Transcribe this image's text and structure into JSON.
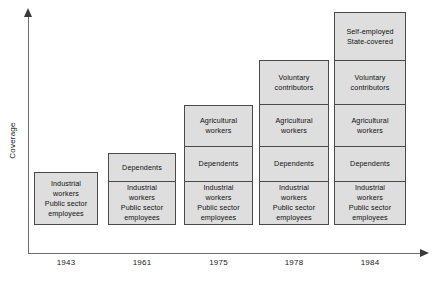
{
  "chart_data": {
    "type": "bar",
    "title": "",
    "subtitle": "",
    "xlabel": "",
    "ylabel": "Coverage",
    "stacked": true,
    "grid": false,
    "legend": false,
    "legend_position": "none",
    "axis_style": "arrow-axes, no tick marks, no numeric scale",
    "categories": [
      "1943",
      "1961",
      "1975",
      "1978",
      "1984"
    ],
    "series": [
      {
        "name": "Industrial workers / Public sector employees",
        "lines": [
          "Industrial",
          "workers",
          "Public sector",
          "employees"
        ],
        "values": [
          1,
          1,
          1,
          1,
          1
        ]
      },
      {
        "name": "Dependents",
        "lines": [
          "Dependents"
        ],
        "values": [
          0,
          1,
          1,
          1,
          1
        ]
      },
      {
        "name": "Agricultural workers",
        "lines": [
          "Agricultural",
          "workers"
        ],
        "values": [
          0,
          0,
          1,
          1,
          1
        ]
      },
      {
        "name": "Voluntary contributors",
        "lines": [
          "Voluntary",
          "contributors"
        ],
        "values": [
          0,
          0,
          0,
          1,
          1
        ]
      },
      {
        "name": "Self-employed / State-covered",
        "lines": [
          "Self-employed",
          "State-covered"
        ],
        "values": [
          0,
          0,
          0,
          0,
          1
        ]
      }
    ],
    "bar_totals_segments": [
      1,
      2,
      3,
      4,
      5
    ],
    "ylim": [
      0,
      5
    ]
  },
  "axes": {
    "y_title": "Coverage",
    "x_tick_labels": [
      "1943",
      "1961",
      "1975",
      "1978",
      "1984"
    ]
  },
  "bars": [
    {
      "year": "1943",
      "left": 34,
      "width": 64,
      "segments": [
        {
          "top": 200,
          "height": 53,
          "lines": [
            "Industrial",
            "workers",
            "Public sector",
            "employees"
          ]
        }
      ]
    },
    {
      "year": "1961",
      "left": 108,
      "width": 68,
      "segments": [
        {
          "top": 180,
          "height": 29,
          "lines": [
            "Dependents"
          ]
        },
        {
          "top": 209,
          "height": 44,
          "lines": [
            "Industrial",
            "workers",
            "Public sector",
            "employees"
          ]
        }
      ]
    },
    {
      "year": "1975",
      "left": 184,
      "width": 69,
      "segments": [
        {
          "top": 131,
          "height": 42,
          "lines": [
            "Agricultural",
            "workers"
          ]
        },
        {
          "top": 173,
          "height": 36,
          "lines": [
            "Dependents"
          ]
        },
        {
          "top": 209,
          "height": 44,
          "lines": [
            "Industrial",
            "workers",
            "Public sector",
            "employees"
          ]
        }
      ]
    },
    {
      "year": "1978",
      "left": 259,
      "width": 70,
      "segments": [
        {
          "top": 85,
          "height": 45,
          "lines": [
            "Voluntary",
            "contributors"
          ]
        },
        {
          "top": 130,
          "height": 43,
          "lines": [
            "Agricultural",
            "workers"
          ]
        },
        {
          "top": 173,
          "height": 36,
          "lines": [
            "Dependents"
          ]
        },
        {
          "top": 209,
          "height": 44,
          "lines": [
            "Industrial",
            "workers",
            "Public sector",
            "employees"
          ]
        }
      ]
    },
    {
      "year": "1984",
      "left": 334,
      "width": 72,
      "segments": [
        {
          "top": 36,
          "height": 49,
          "lines": [
            "Self-employed",
            "State-covered"
          ]
        },
        {
          "top": 85,
          "height": 45,
          "lines": [
            "Voluntary",
            "contributors"
          ]
        },
        {
          "top": 130,
          "height": 43,
          "lines": [
            "Agricultural",
            "workers"
          ]
        },
        {
          "top": 173,
          "height": 36,
          "lines": [
            "Dependents"
          ]
        },
        {
          "top": 209,
          "height": 44,
          "lines": [
            "Industrial",
            "workers",
            "Public sector",
            "employees"
          ]
        }
      ]
    }
  ],
  "colors": {
    "segment_fill": "#dedede",
    "segment_border": "#4a4a4a",
    "axis": "#6d6d6d",
    "arrow": "#3a3a3a",
    "text": "#101010",
    "background": "#ffffff"
  }
}
